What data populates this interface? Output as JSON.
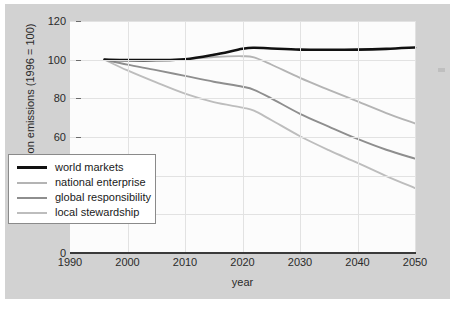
{
  "chart_data": {
    "type": "line",
    "title": "",
    "xlabel": "year",
    "ylabel": "index of carbon emissions (1996 = 100)",
    "xlim": [
      1990,
      2050
    ],
    "ylim": [
      0,
      120
    ],
    "xticks": [
      1990,
      2000,
      2010,
      2020,
      2030,
      2040,
      2050
    ],
    "yticks": [
      0,
      20,
      40,
      60,
      80,
      100,
      120
    ],
    "grid": true,
    "legend_position": "lower left",
    "x": [
      1996,
      2000,
      2005,
      2010,
      2015,
      2020,
      2022,
      2025,
      2030,
      2035,
      2040,
      2045,
      2050
    ],
    "series": [
      {
        "name": "world markets",
        "color": "#111111",
        "width": 2.6,
        "values": [
          100,
          99.8,
          99.8,
          100.2,
          102.5,
          105.6,
          106.2,
          105.8,
          105.2,
          105.1,
          105.2,
          105.6,
          106.3
        ]
      },
      {
        "name": "national enterprise",
        "color": "#b4b4b4",
        "width": 1.9,
        "values": [
          100,
          99.4,
          99.6,
          100.2,
          101.4,
          101.8,
          101.2,
          97.5,
          90.6,
          84.4,
          78.4,
          72.4,
          67.0
        ]
      },
      {
        "name": "global responsibility",
        "color": "#8e8e8e",
        "width": 1.9,
        "values": [
          100,
          97.4,
          94.6,
          91.6,
          88.6,
          86.0,
          84.4,
          80.0,
          72.0,
          65.4,
          59.0,
          53.4,
          48.8
        ]
      },
      {
        "name": "local stewardship",
        "color": "#bdbdbd",
        "width": 1.9,
        "values": [
          100,
          94.4,
          88.2,
          82.4,
          78.0,
          75.2,
          73.6,
          68.8,
          60.4,
          53.2,
          46.6,
          39.8,
          33.6
        ]
      }
    ]
  },
  "axes": {
    "y_title": "index of carbon emissions (1996 = 100)",
    "x_title": "year",
    "y_tick_labels": [
      "120",
      "100",
      "80",
      "60",
      "40",
      "20",
      "0"
    ],
    "x_tick_labels": [
      "1990",
      "2000",
      "2010",
      "2020",
      "2030",
      "2040",
      "2050"
    ]
  },
  "legend": {
    "items": [
      {
        "label": "world markets"
      },
      {
        "label": "national enterprise"
      },
      {
        "label": "global responsibility"
      },
      {
        "label": "local stewardship"
      }
    ]
  },
  "colors": {
    "page_background": "#d2d2d2",
    "plot_background": "#fcfcfc",
    "gridline": "#e2e2e2",
    "axis": "#3a3a3a",
    "text": "#2a2a2a"
  }
}
